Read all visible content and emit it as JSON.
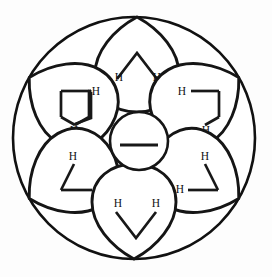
{
  "figure": {
    "background_color": "#fdfdfd",
    "line_color": "#151515",
    "label_color": "#101010"
  },
  "outer_ring": {
    "name": "outer-boundary-circle",
    "cx": 134,
    "cy": 138,
    "r": 121
  },
  "core": {
    "name": "central-ring",
    "cx": 139,
    "cy": 141,
    "r": 29,
    "bond_label": "—",
    "bond": {
      "x1": 120,
      "y1": 145,
      "x2": 158,
      "y2": 145
    }
  },
  "lobes": [
    {
      "id": "lobe-top",
      "position": "top",
      "cx": 137,
      "cy": 63,
      "rx": 40,
      "ry": 46,
      "rotation": 0,
      "bond_shape": "caret-up",
      "hydrogens": [
        {
          "label": "H",
          "x": 119,
          "y": 78
        },
        {
          "label": "H",
          "x": 157,
          "y": 78
        }
      ]
    },
    {
      "id": "lobe-upper-left",
      "position": "upper-left",
      "cx": 72,
      "cy": 102,
      "rx": 40,
      "ry": 46,
      "rotation": -60,
      "bond_shape": "caret-rotated-ccw",
      "hydrogens": [
        {
          "label": "H",
          "x": 96,
          "y": 94
        },
        {
          "label": "H",
          "x": 74,
          "y": 130
        }
      ]
    },
    {
      "id": "lobe-upper-right",
      "position": "upper-right",
      "cx": 203,
      "cy": 102,
      "rx": 40,
      "ry": 46,
      "rotation": 60,
      "bond_shape": "caret-rotated-cw",
      "hydrogens": [
        {
          "label": "H",
          "x": 182,
          "y": 94
        },
        {
          "label": "H",
          "x": 206,
          "y": 130
        }
      ]
    },
    {
      "id": "lobe-lower-left",
      "position": "lower-left",
      "cx": 72,
      "cy": 180,
      "rx": 40,
      "ry": 46,
      "rotation": -120,
      "bond_shape": "caret-rotated-ccw2",
      "hydrogens": [
        {
          "label": "H",
          "x": 73,
          "y": 156
        },
        {
          "label": "H",
          "x": 98,
          "y": 190
        }
      ]
    },
    {
      "id": "lobe-lower-right",
      "position": "lower-right",
      "cx": 203,
      "cy": 180,
      "rx": 40,
      "ry": 46,
      "rotation": 120,
      "bond_shape": "caret-rotated-cw2",
      "hydrogens": [
        {
          "label": "H",
          "x": 204,
          "y": 156
        },
        {
          "label": "H",
          "x": 180,
          "y": 190
        }
      ]
    },
    {
      "id": "lobe-bottom",
      "position": "bottom",
      "cx": 137,
      "cy": 218,
      "rx": 40,
      "ry": 46,
      "rotation": 180,
      "bond_shape": "caret-down",
      "hydrogens": [
        {
          "label": "H",
          "x": 118,
          "y": 203
        },
        {
          "label": "H",
          "x": 156,
          "y": 203
        }
      ]
    }
  ],
  "hydrogen_label": "H",
  "hydrogen_count": 12
}
